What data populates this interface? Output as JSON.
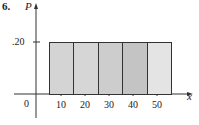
{
  "problem_number": "6.",
  "chart_data": {
    "type": "bar",
    "title": "",
    "xlabel": "x",
    "ylabel": "P",
    "categories": [
      "10",
      "20",
      "30",
      "40",
      "50"
    ],
    "values": [
      0.2,
      0.2,
      0.2,
      0.2,
      0.2
    ],
    "x_ticks": [
      "10",
      "20",
      "30",
      "40",
      "50"
    ],
    "y_ticks": [
      ".20"
    ],
    "origin_label": "0",
    "ylim": [
      0,
      0.25
    ],
    "grid": false,
    "legend": null,
    "bar_colors": [
      "#d4d4d4",
      "#d6d6d6",
      "#cdcdcd",
      "#c4c4c4",
      "#e4e4e4"
    ]
  }
}
